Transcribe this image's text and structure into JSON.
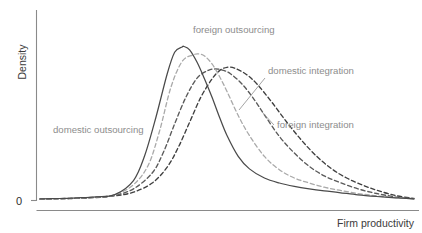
{
  "chart_data": {
    "type": "line",
    "title": "",
    "subtitle": "",
    "xlabel": "Firm productivity",
    "ylabel": "Density",
    "xticklabels": [],
    "yticklabels": [
      "0"
    ],
    "ylim": [
      0,
      1.0
    ],
    "xlim": [
      0,
      1.0
    ],
    "grid": false,
    "legend_position": "inline-annotations",
    "annotations": [
      {
        "text": "domestic outsourcing",
        "series": "domestic outsourcing",
        "x_px": 53,
        "y_px": 133
      },
      {
        "text": "foreign outsourcing",
        "series": "foreign outsourcing",
        "x_px": 193,
        "y_px": 33
      },
      {
        "text": "domestic integration",
        "series": "domestic integration",
        "x_px": 268,
        "y_px": 74
      },
      {
        "text": "foreign integration",
        "series": "foreign integration",
        "x_px": 277,
        "y_px": 128
      }
    ],
    "series": [
      {
        "name": "domestic outsourcing",
        "style": "solid",
        "color": "#4a4a4a",
        "peak_x": 0.385,
        "peak_y": 0.925,
        "x": [
          0.0,
          0.05,
          0.1,
          0.15,
          0.2,
          0.25,
          0.28,
          0.31,
          0.34,
          0.36,
          0.38,
          0.385,
          0.4,
          0.42,
          0.44,
          0.46,
          0.48,
          0.5,
          0.53,
          0.56,
          0.6,
          0.64,
          0.68,
          0.72,
          0.76,
          0.8,
          0.85,
          0.9,
          0.95,
          1.0
        ],
        "values": [
          0.01,
          0.012,
          0.016,
          0.022,
          0.035,
          0.12,
          0.27,
          0.5,
          0.76,
          0.89,
          0.922,
          0.925,
          0.905,
          0.83,
          0.73,
          0.62,
          0.5,
          0.39,
          0.265,
          0.19,
          0.135,
          0.105,
          0.085,
          0.07,
          0.058,
          0.048,
          0.034,
          0.024,
          0.016,
          0.01
        ]
      },
      {
        "name": "foreign outsourcing",
        "style": "dashed",
        "color": "#a9a9a9",
        "peak_x": 0.425,
        "peak_y": 0.88,
        "x": [
          0.0,
          0.05,
          0.1,
          0.15,
          0.2,
          0.25,
          0.29,
          0.32,
          0.35,
          0.38,
          0.41,
          0.425,
          0.44,
          0.46,
          0.48,
          0.5,
          0.53,
          0.56,
          0.6,
          0.64,
          0.68,
          0.72,
          0.76,
          0.8,
          0.85,
          0.9,
          0.95,
          1.0
        ],
        "values": [
          0.009,
          0.011,
          0.015,
          0.021,
          0.034,
          0.095,
          0.215,
          0.42,
          0.68,
          0.835,
          0.875,
          0.88,
          0.868,
          0.82,
          0.745,
          0.655,
          0.51,
          0.39,
          0.265,
          0.185,
          0.135,
          0.105,
          0.08,
          0.062,
          0.042,
          0.028,
          0.018,
          0.01
        ]
      },
      {
        "name": "domestic integration",
        "style": "dashed",
        "color": "#5a5a5a",
        "peak_x": 0.47,
        "peak_y": 0.79,
        "x": [
          0.0,
          0.05,
          0.1,
          0.15,
          0.2,
          0.25,
          0.3,
          0.33,
          0.36,
          0.39,
          0.42,
          0.45,
          0.47,
          0.49,
          0.51,
          0.54,
          0.57,
          0.6,
          0.64,
          0.68,
          0.72,
          0.76,
          0.8,
          0.85,
          0.9,
          0.95,
          1.0
        ],
        "values": [
          0.009,
          0.011,
          0.014,
          0.02,
          0.032,
          0.07,
          0.165,
          0.29,
          0.46,
          0.62,
          0.735,
          0.782,
          0.79,
          0.782,
          0.76,
          0.7,
          0.615,
          0.515,
          0.385,
          0.285,
          0.205,
          0.148,
          0.11,
          0.07,
          0.042,
          0.022,
          0.01
        ]
      },
      {
        "name": "foreign integration",
        "style": "dashed",
        "color": "#3f3f3f",
        "peak_x": 0.5,
        "peak_y": 0.8,
        "x": [
          0.0,
          0.05,
          0.1,
          0.15,
          0.2,
          0.25,
          0.3,
          0.34,
          0.37,
          0.4,
          0.43,
          0.46,
          0.48,
          0.5,
          0.52,
          0.55,
          0.58,
          0.62,
          0.66,
          0.7,
          0.74,
          0.78,
          0.82,
          0.86,
          0.9,
          0.95,
          1.0
        ],
        "values": [
          0.008,
          0.01,
          0.013,
          0.018,
          0.028,
          0.05,
          0.105,
          0.2,
          0.32,
          0.47,
          0.62,
          0.73,
          0.78,
          0.8,
          0.795,
          0.76,
          0.7,
          0.59,
          0.47,
          0.36,
          0.265,
          0.19,
          0.135,
          0.095,
          0.062,
          0.03,
          0.012
        ]
      }
    ]
  },
  "axes": {
    "ylabel": "Density",
    "xlabel": "Firm productivity",
    "zero_tick": "0"
  }
}
